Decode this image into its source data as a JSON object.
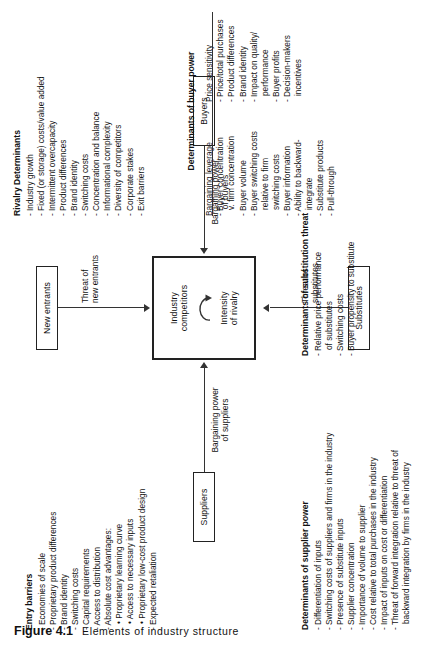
{
  "figure": {
    "number": "Figure 4.1",
    "title": "Elements of industry structure"
  },
  "boxes": {
    "new_entrants": "New entrants",
    "suppliers": "Suppliers",
    "buyers": "Buyers",
    "substitutes": "Substitutes",
    "industry_competitors": "Industry\ncompetitors",
    "intensity_of_rivalry": "Intensity\nof rivalry"
  },
  "edge_labels": {
    "threat_of_new_entrants": "Threat of\nnew entrants",
    "bargaining_power_of_suppliers": "Bargaining power\nof suppliers",
    "bargaining_power_of_buyers": "Bargaining power\nof buyers",
    "threat_of_substitutes": "Threat of\nsubstitutes"
  },
  "blocks": {
    "entry_barriers": {
      "title": "Entry barriers",
      "items": [
        {
          "text": "- Economies of scale",
          "level": 1
        },
        {
          "text": "- Proprietary product differences",
          "level": 1
        },
        {
          "text": "- Brand identity",
          "level": 1
        },
        {
          "text": "- Switching costs",
          "level": 1
        },
        {
          "text": "- Capital requirements",
          "level": 1
        },
        {
          "text": "- Access to distribution",
          "level": 1
        },
        {
          "text": "- Absolute cost advantages:",
          "level": 1
        },
        {
          "text": "• Proprietary learning  curve",
          "level": 2
        },
        {
          "text": "• Access to necessary inputs",
          "level": 2
        },
        {
          "text": "• Proprietary low-cost product design",
          "level": 2
        },
        {
          "text": "- Expected retaliation",
          "level": 1
        }
      ]
    },
    "rivalry_determinants": {
      "title": "Rivalry Determinants",
      "items": [
        {
          "text": "- Industry growth",
          "level": 1
        },
        {
          "text": "- Fixed (or storage) costs/value added",
          "level": 1
        },
        {
          "text": "- Intermittent overcapacity",
          "level": 1
        },
        {
          "text": "- Product differences",
          "level": 1
        },
        {
          "text": "- Brand identity",
          "level": 1
        },
        {
          "text": "- Switching costs",
          "level": 1
        },
        {
          "text": "- Concentration and balance",
          "level": 1
        },
        {
          "text": "- Informational complexity",
          "level": 1
        },
        {
          "text": "- Diversity of competitors",
          "level": 1
        },
        {
          "text": "- Corporate stakes",
          "level": 1
        },
        {
          "text": "- Exit barriers",
          "level": 1
        }
      ]
    },
    "supplier_power": {
      "title": "Determinants of supplier power",
      "items": [
        {
          "text": "- Differentiation of inputs",
          "level": 1
        },
        {
          "text": "- Switching costs of suppliers and firms in the industry",
          "level": 1
        },
        {
          "text": "- Presence of substitute inputs",
          "level": 1
        },
        {
          "text": "- Supplier concentration",
          "level": 1
        },
        {
          "text": "- Importance of volume to supplier",
          "level": 1
        },
        {
          "text": "- Cost relative to total purchases in the industry",
          "level": 1
        },
        {
          "text": "- Impact of inputs on cost or differentiation",
          "level": 1
        },
        {
          "text": "- Threat of forward integration relative to threat of",
          "level": 1
        },
        {
          "text": "  backward integration by firms in the industry",
          "level": 2
        }
      ]
    },
    "substitution_threat": {
      "title": "Determinants of substitution threat",
      "items": [
        {
          "text": "- Relative price performance",
          "level": 1
        },
        {
          "text": "  of substitutes",
          "level": 2
        },
        {
          "text": "- Switching costs",
          "level": 1
        },
        {
          "text": "- Buyer propensity to substitute",
          "level": 1
        }
      ]
    },
    "buyer_power": {
      "title": "Determinants of buyer power",
      "columns": [
        {
          "heading": "Bargaining leverage",
          "items": [
            {
              "text": "- Buyer concentration",
              "level": 1
            },
            {
              "text": "  v. firm concentration",
              "level": 2
            },
            {
              "text": "- Buyer volume",
              "level": 1
            },
            {
              "text": "- Buyer switching costs",
              "level": 1
            },
            {
              "text": "  relative to firm",
              "level": 2
            },
            {
              "text": "  switching costs",
              "level": 2
            },
            {
              "text": "- Buyer information",
              "level": 1
            },
            {
              "text": "- Ability to backward-",
              "level": 1
            },
            {
              "text": "  integrate",
              "level": 2
            },
            {
              "text": "- Substitute products",
              "level": 1
            },
            {
              "text": "- Pull-through",
              "level": 1
            }
          ]
        },
        {
          "heading": "Price sensitivity",
          "items": [
            {
              "text": "- Price/total purchases",
              "level": 1
            },
            {
              "text": "- Product differences",
              "level": 1
            },
            {
              "text": "- Brand identity",
              "level": 1
            },
            {
              "text": "- Impact on quality/",
              "level": 1
            },
            {
              "text": "  performance",
              "level": 2
            },
            {
              "text": "- Buyer profits",
              "level": 1
            },
            {
              "text": "- Decision-makers",
              "level": 1
            },
            {
              "text": "  incentives",
              "level": 2
            }
          ]
        }
      ]
    }
  }
}
